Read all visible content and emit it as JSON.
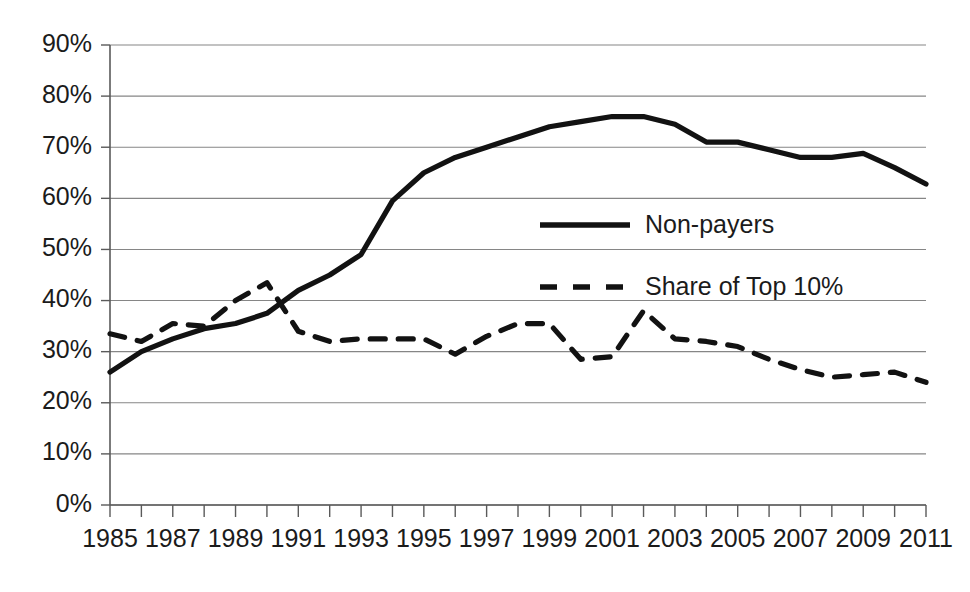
{
  "chart_data": {
    "type": "line",
    "title": "",
    "subtitle": "",
    "xlabel": "",
    "ylabel": "",
    "x": [
      1985,
      1986,
      1987,
      1988,
      1989,
      1990,
      1991,
      1992,
      1993,
      1994,
      1995,
      1996,
      1997,
      1998,
      1999,
      2000,
      2001,
      2002,
      2003,
      2004,
      2005,
      2006,
      2007,
      2008,
      2009,
      2010,
      2011
    ],
    "xlim": [
      1985,
      2011
    ],
    "ylim": [
      0,
      90
    ],
    "grid": true,
    "grid_axis": "y",
    "legend_position": "center-right",
    "y_tick_labels": [
      "0%",
      "10%",
      "20%",
      "30%",
      "40%",
      "50%",
      "60%",
      "70%",
      "80%",
      "90%"
    ],
    "y_tick_values": [
      0,
      10,
      20,
      30,
      40,
      50,
      60,
      70,
      80,
      90
    ],
    "x_tick_labels": [
      "1985",
      "1987",
      "1989",
      "1991",
      "1993",
      "1995",
      "1997",
      "1999",
      "2001",
      "2003",
      "2005",
      "2007",
      "2009",
      "2011"
    ],
    "x_tick_values": [
      1985,
      1987,
      1989,
      1991,
      1993,
      1995,
      1997,
      1999,
      2001,
      2003,
      2005,
      2007,
      2009,
      2011
    ],
    "x_minor_ticks": [
      1985,
      1986,
      1987,
      1988,
      1989,
      1990,
      1991,
      1992,
      1993,
      1994,
      1995,
      1996,
      1997,
      1998,
      1999,
      2000,
      2001,
      2002,
      2003,
      2004,
      2005,
      2006,
      2007,
      2008,
      2009,
      2010,
      2011
    ],
    "series": [
      {
        "name": "Non-payers",
        "style": "solid",
        "color": "#121212",
        "x": [
          1985,
          1986,
          1987,
          1988,
          1989,
          1990,
          1991,
          1992,
          1993,
          1994,
          1995,
          1996,
          1997,
          1998,
          1999,
          2000,
          2001,
          2002,
          2003,
          2004,
          2005,
          2006,
          2007,
          2008,
          2009,
          2010,
          2011
        ],
        "values": [
          26,
          30,
          32.5,
          34.5,
          35.5,
          37.5,
          42,
          45,
          49,
          59.5,
          65,
          68,
          70,
          72,
          74,
          75,
          76,
          76,
          74.5,
          71,
          71,
          69.5,
          68,
          68,
          68.8,
          66,
          62.8
        ]
      },
      {
        "name": "Share of Top 10%",
        "style": "dashed",
        "color": "#121212",
        "x": [
          1985,
          1986,
          1987,
          1988,
          1989,
          1990,
          1991,
          1992,
          1993,
          1994,
          1995,
          1996,
          1997,
          1998,
          1999,
          2000,
          2001,
          2002,
          2003,
          2004,
          2005,
          2006,
          2007,
          2008,
          2009,
          2010,
          2011
        ],
        "values": [
          33.5,
          32,
          35.5,
          35,
          40,
          43.5,
          34,
          32,
          32.5,
          32.5,
          32.5,
          29.5,
          33,
          35.5,
          35.5,
          28.5,
          29,
          38,
          32.5,
          32,
          31,
          28.5,
          26.5,
          25,
          25.5,
          26,
          24
        ]
      }
    ],
    "legend": [
      {
        "label": "Non-payers",
        "style": "solid"
      },
      {
        "label": "Share of Top 10%",
        "style": "dashed"
      }
    ],
    "colors": {
      "background": "#ffffff",
      "gridline": "#868686",
      "axis": "#5a5a5a",
      "text": "#1b1b1b",
      "series": "#121212"
    }
  }
}
